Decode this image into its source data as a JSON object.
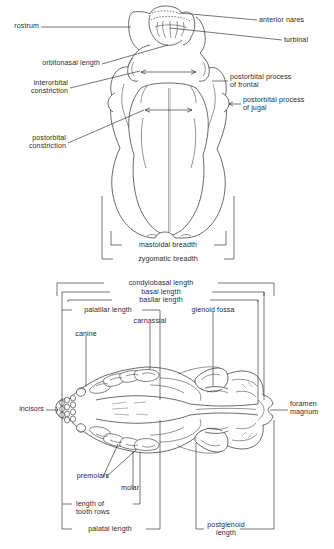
{
  "figure": {
    "panels": [
      {
        "id": "dorsal-view",
        "view_label": "dorsal view of skull",
        "labels": [
          {
            "key": "rostrum",
            "text": "rostrum",
            "align": "right"
          },
          {
            "key": "orbitonasal_length",
            "text": "orbitonasal length",
            "align": "right"
          },
          {
            "key": "interorbital_constriction",
            "text": "interorbital\nconstriction",
            "align": "right"
          },
          {
            "key": "postorbital_constriction",
            "text": "postorbital\nconstriction",
            "align": "right"
          },
          {
            "key": "anterior_nares",
            "text": "anterior nares",
            "align": "left"
          },
          {
            "key": "turbinal",
            "text": "turbinal",
            "align": "left"
          },
          {
            "key": "postorbital_process_frontal",
            "text": "postorbital process\nof frontal",
            "align": "left"
          },
          {
            "key": "postorbital_process_jugal",
            "text": "postorbital process\nof jugal",
            "align": "left"
          },
          {
            "key": "mastoidal_breadth",
            "text": "mastoidal breadth",
            "align": "center"
          },
          {
            "key": "zygomatic_breadth",
            "text": "zygomatic breadth",
            "align": "center"
          }
        ]
      },
      {
        "id": "ventral-view",
        "view_label": "ventral view of skull",
        "labels": [
          {
            "key": "condylobasal_length",
            "text": "condylobasal length",
            "align": "center"
          },
          {
            "key": "basal_length",
            "text": "basal length",
            "align": "center"
          },
          {
            "key": "basilar_length",
            "text": "basilar length",
            "align": "center"
          },
          {
            "key": "palatilar_length",
            "text": "palatilar length",
            "align": "center"
          },
          {
            "key": "glenoid_fossa",
            "text": "glenoid fossa",
            "align": "center"
          },
          {
            "key": "carnassial",
            "text": "carnassial",
            "align": "center"
          },
          {
            "key": "canine",
            "text": "canine",
            "align": "center"
          },
          {
            "key": "incisors",
            "text": "incisors",
            "align": "right"
          },
          {
            "key": "foramen_magnum",
            "text": "foramen\nmagnum",
            "align": "left"
          },
          {
            "key": "premolars",
            "text": "premolars",
            "align": "center"
          },
          {
            "key": "molar",
            "text": "molar",
            "align": "center"
          },
          {
            "key": "length_of_tooth_rows",
            "text": "length of\ntooth rows",
            "align": "left"
          },
          {
            "key": "palatal_length",
            "text": "palatal length",
            "align": "center"
          },
          {
            "key": "postglenoid_length",
            "text": "postglenoid\nlength",
            "align": "center"
          }
        ]
      }
    ],
    "colors": {
      "ink": "#2b2b2b",
      "background": "#ffffff",
      "leader_line": "#2b2b2b"
    }
  }
}
